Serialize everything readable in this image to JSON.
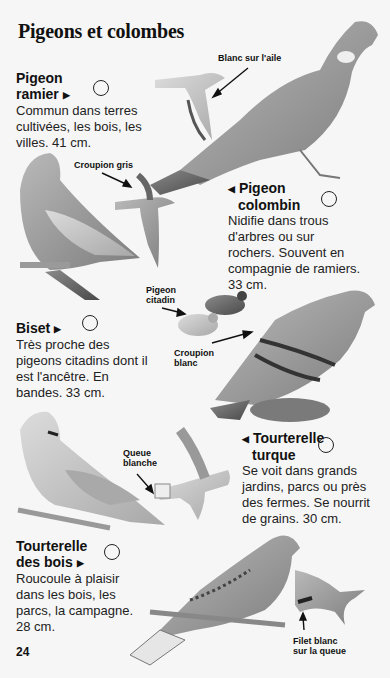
{
  "page": {
    "title": "Pigeons et colombes",
    "page_number": "24"
  },
  "entries": [
    {
      "name_line1": "Pigeon",
      "name_line2": "ramier",
      "pointer": "▶",
      "description": [
        "Commun dans terres",
        "cultivées, les bois, les",
        "villes. 41 cm."
      ]
    },
    {
      "name_line1": "Pigeon",
      "name_line2": "colombin",
      "pointer": "◀",
      "description": [
        "Nidifie dans trous",
        "d'arbres ou sur",
        "rochers. Souvent en",
        "compagnie de ramiers.",
        "33 cm."
      ]
    },
    {
      "name_line1": "Biset",
      "name_line2": "",
      "pointer": "▶",
      "description": [
        "Très proche des",
        "pigeons citadins dont il",
        "est l'ancêtre. En",
        "bandes. 33 cm."
      ]
    },
    {
      "name_line1": "Tourterelle",
      "name_line2": "turque",
      "pointer": "◀",
      "description": [
        "Se voit dans grands",
        "jardins, parcs ou près",
        "des fermes. Se nourrit",
        "de grains. 30 cm."
      ]
    },
    {
      "name_line1": "Tourterelle",
      "name_line2": "des bois",
      "pointer": "▶",
      "description": [
        "Roucoule à plaisir",
        "dans les bois, les",
        "parcs, la campagne.",
        "28 cm."
      ]
    }
  ],
  "annotations": {
    "blanc_aile": "Blanc sur l'aile",
    "croupion_gris": "Croupion gris",
    "pigeon_citadin_1": "Pigeon",
    "pigeon_citadin_2": "citadin",
    "croupion_blanc_1": "Croupion",
    "croupion_blanc_2": "blanc",
    "queue_blanche_1": "Queue",
    "queue_blanche_2": "blanche",
    "filet_blanc_1": "Filet blanc",
    "filet_blanc_2": "sur la queue"
  }
}
